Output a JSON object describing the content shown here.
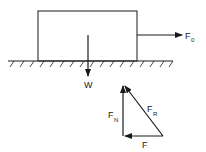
{
  "diagram": {
    "labels": {
      "applied_force": {
        "main": "F",
        "sub": "0"
      },
      "weight": {
        "main": "W",
        "sub": ""
      },
      "normal_force": {
        "main": "F",
        "sub": "N"
      },
      "resultant_force": {
        "main": "F",
        "sub": "R"
      },
      "friction_force": {
        "main": "F",
        "sub": ""
      }
    },
    "colors": {
      "stroke": "#1a1a1a",
      "background": "#ffffff"
    }
  }
}
